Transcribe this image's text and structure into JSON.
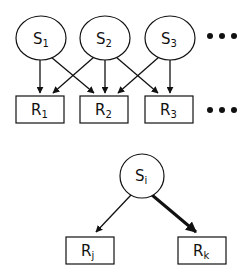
{
  "diagram": {
    "top": {
      "sources": [
        {
          "label": "S",
          "sub": "1"
        },
        {
          "label": "S",
          "sub": "2"
        },
        {
          "label": "S",
          "sub": "3"
        }
      ],
      "receivers": [
        {
          "label": "R",
          "sub": "1"
        },
        {
          "label": "R",
          "sub": "2"
        },
        {
          "label": "R",
          "sub": "3"
        }
      ],
      "ellipsis": "• • •",
      "edges": [
        {
          "from": "S1",
          "to": "R1"
        },
        {
          "from": "S1",
          "to": "R2"
        },
        {
          "from": "S2",
          "to": "R1"
        },
        {
          "from": "S2",
          "to": "R2"
        },
        {
          "from": "S2",
          "to": "R3"
        },
        {
          "from": "S3",
          "to": "R2"
        },
        {
          "from": "S3",
          "to": "R3"
        }
      ]
    },
    "bottom": {
      "source": {
        "label": "S",
        "sub": "i"
      },
      "receivers": [
        {
          "label": "R",
          "sub": "j"
        },
        {
          "label": "R",
          "sub": "k"
        }
      ],
      "edges": [
        {
          "from": "Si",
          "to": "Rj",
          "weight": "thin"
        },
        {
          "from": "Si",
          "to": "Rk",
          "weight": "thick"
        }
      ]
    }
  }
}
